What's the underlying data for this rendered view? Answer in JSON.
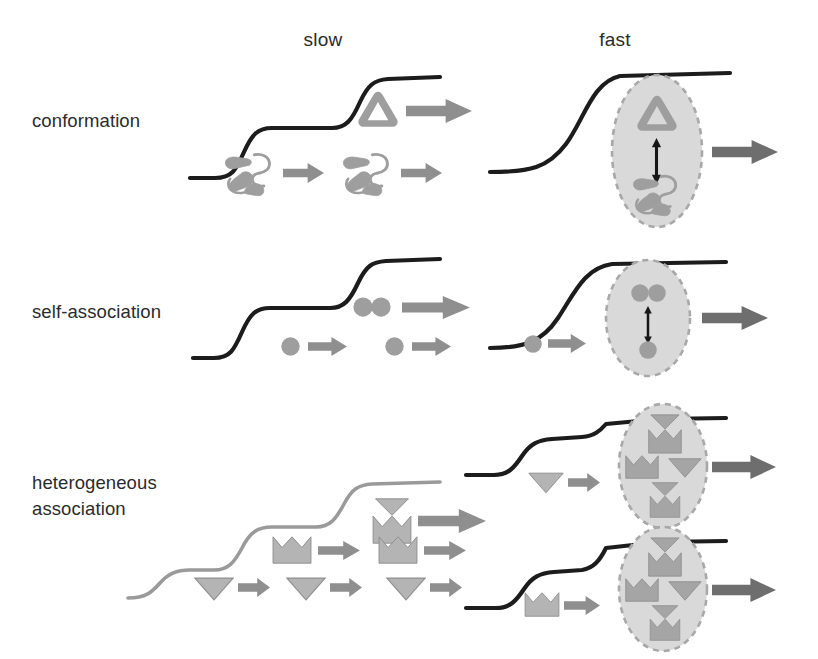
{
  "figure": {
    "kind": "scientific-schematic",
    "background_color": "#ffffff"
  },
  "columns": [
    {
      "id": "slow",
      "label": "slow"
    },
    {
      "id": "fast",
      "label": "fast"
    }
  ],
  "rows": [
    {
      "id": "conformation",
      "label": "conformation",
      "label_lines": [
        "conformation"
      ],
      "slow": {
        "curve": {
          "style": "staircase",
          "steps": 2,
          "color": "#1c1c1c",
          "description": "stepped sigmoidal titration curve with two resolved plateaus"
        },
        "states": [
          {
            "tier": "upper",
            "species": [
              "folded-triangle"
            ],
            "count": 1,
            "arrow": "long"
          },
          {
            "tier": "lower",
            "species": [
              "unfolded-coil"
            ],
            "count": 2,
            "arrow": "short"
          }
        ]
      },
      "fast": {
        "curve": {
          "style": "sigmoid",
          "steps": 1,
          "color": "#1c1c1c",
          "description": "single smooth averaged sigmoidal curve"
        },
        "ensemble": {
          "shape": "ellipse",
          "fill": "#d9d9d9",
          "border": "dashed",
          "border_color": "#a8a8a8",
          "contents": [
            "folded-triangle",
            "unfolded-coil"
          ],
          "exchange_arrow": "double-headed-vertical"
        },
        "arrow": "long"
      }
    },
    {
      "id": "self-association",
      "label": "self-association",
      "label_lines": [
        "self-association"
      ],
      "slow": {
        "curve": {
          "style": "staircase",
          "steps": 2,
          "color": "#1c1c1c",
          "description": "stepped sigmoidal titration curve with two resolved plateaus"
        },
        "states": [
          {
            "tier": "upper",
            "species": [
              "dimer-circle-pair"
            ],
            "count": 1,
            "arrow": "long"
          },
          {
            "tier": "lower",
            "species": [
              "monomer-circle"
            ],
            "count": 2,
            "arrow": "short"
          }
        ]
      },
      "fast": {
        "curve": {
          "style": "sigmoid",
          "steps": 1,
          "color": "#1c1c1c",
          "description": "single smooth averaged sigmoidal curve"
        },
        "ensemble": {
          "shape": "ellipse",
          "fill": "#d9d9d9",
          "border": "dashed",
          "border_color": "#a8a8a8",
          "contents": [
            "dimer-circle-pair",
            "monomer-circle"
          ],
          "exchange_arrow": "double-headed-vertical"
        },
        "arrow": "long",
        "input_species": "monomer-circle"
      }
    },
    {
      "id": "heterogeneous-association",
      "label": "heterogeneous association",
      "label_lines": [
        "heterogeneous",
        "association"
      ],
      "slow": {
        "curve": {
          "style": "staircase",
          "steps": 3,
          "color": "#9a9a9a",
          "description": "three-step staircase titration curve drawn in light grey"
        },
        "states": [
          {
            "tier": "upper",
            "species": [
              "complex-envelope"
            ],
            "count": 1,
            "arrow": "long"
          },
          {
            "tier": "middle",
            "species": [
              "partner-bowtie"
            ],
            "count": 2,
            "arrow": "short"
          },
          {
            "tier": "lower",
            "species": [
              "ligand-triangle"
            ],
            "count": 3,
            "arrow": "short"
          }
        ]
      },
      "fast": [
        {
          "curve": {
            "style": "staircase",
            "steps": 2,
            "color": "#1c1c1c",
            "description": "two-step curve feeding the upper ensemble"
          },
          "input_species": "ligand-triangle",
          "ensemble": {
            "shape": "ellipse",
            "fill": "#d9d9d9",
            "border": "dashed",
            "border_color": "#a8a8a8",
            "contents": [
              "complex-envelope",
              "partner-bowtie",
              "ligand-triangle",
              "complex-envelope"
            ],
            "exchange_arrow": "none"
          },
          "arrow": "long"
        },
        {
          "curve": {
            "style": "staircase",
            "steps": 2,
            "color": "#1c1c1c",
            "description": "two-step curve feeding the lower ensemble"
          },
          "input_species": "partner-bowtie",
          "ensemble": {
            "shape": "ellipse",
            "fill": "#d9d9d9",
            "border": "dashed",
            "border_color": "#a8a8a8",
            "contents": [
              "complex-envelope",
              "partner-bowtie",
              "ligand-triangle",
              "complex-envelope"
            ],
            "exchange_arrow": "none"
          },
          "arrow": "long"
        }
      ]
    }
  ],
  "palette": {
    "curve_dark": "#1c1c1c",
    "curve_light": "#9a9a9a",
    "shape_fill": "#a5a5a5",
    "shape_fill_light": "#b4b4b4",
    "shape_stroke": "#8a8a8a",
    "arrow_dark": "#6e6e6e",
    "arrow_mid": "#8f8f8f",
    "ellipse_fill": "#d9d9d9",
    "ellipse_border": "#a8a8a8",
    "exchange_arrow": "#171717",
    "text": "#2b2b2b"
  },
  "icon_names": {
    "folded_triangle": "folded-protein-triangle-icon",
    "unfolded_coil": "unfolded-protein-coil-icon",
    "monomer_circle": "monomer-circle-icon",
    "dimer_pair": "dimer-circle-pair-icon",
    "ligand_triangle": "ligand-triangle-icon",
    "partner_bowtie": "partner-bowtie-icon",
    "complex_envelope": "complex-envelope-icon",
    "flow_arrow": "flow-arrow-icon",
    "exchange_arrow": "exchange-double-arrow-icon",
    "ensemble": "ensemble-ellipse-icon"
  }
}
